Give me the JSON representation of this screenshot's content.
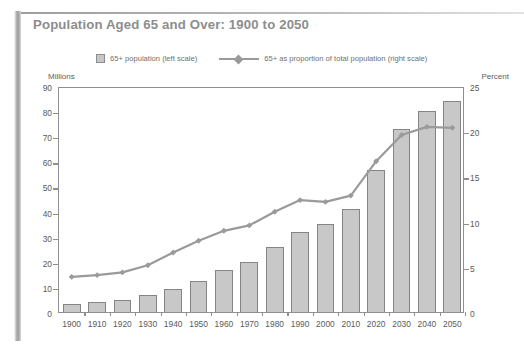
{
  "title": "Population Aged 65 and Over: 1900 to 2050",
  "legend": {
    "bar_label": "65+ population (left scale)",
    "line_label": "65+ as proportion of total population (right scale)"
  },
  "axis_captions": {
    "left": "Millions",
    "right": "Percent"
  },
  "colors": {
    "bar_fill": "#c8c8c8",
    "bar_stroke": "#858585",
    "line": "#9a9a9a",
    "axis": "#8f8f8f",
    "title": "#8d8d8d",
    "text": "#5a5a5a"
  },
  "chart_data": {
    "type": "bar",
    "title": "Population Aged 65 and Over: 1900 to 2050",
    "xlabel": "",
    "ylabel": "Millions",
    "y2label": "Percent",
    "ylim": [
      0,
      90
    ],
    "y2lim": [
      0,
      25
    ],
    "yticks": [
      0,
      10,
      20,
      30,
      40,
      50,
      60,
      70,
      80,
      90
    ],
    "y2ticks": [
      0,
      5,
      10,
      15,
      20,
      25
    ],
    "grid": false,
    "legend_position": "top",
    "categories": [
      "1900",
      "1910",
      "1920",
      "1930",
      "1940",
      "1950",
      "1960",
      "1970",
      "1980",
      "1990",
      "2000",
      "2010",
      "2020",
      "2030",
      "2040",
      "2050"
    ],
    "series": [
      {
        "name": "65+ population (left scale)",
        "type": "bar",
        "axis": "left",
        "unit": "millions",
        "values": [
          3.1,
          3.9,
          4.9,
          6.7,
          9.0,
          12.4,
          16.6,
          20.1,
          25.7,
          31.9,
          35.0,
          40.9,
          56.4,
          72.8,
          80.0,
          84.0
        ]
      },
      {
        "name": "65+ as proportion of total population (right scale)",
        "type": "line",
        "axis": "right",
        "unit": "percent",
        "values": [
          4.1,
          4.3,
          4.6,
          5.4,
          6.8,
          8.1,
          9.2,
          9.8,
          11.3,
          12.6,
          12.4,
          13.1,
          16.9,
          19.8,
          20.7,
          20.6
        ]
      }
    ]
  }
}
